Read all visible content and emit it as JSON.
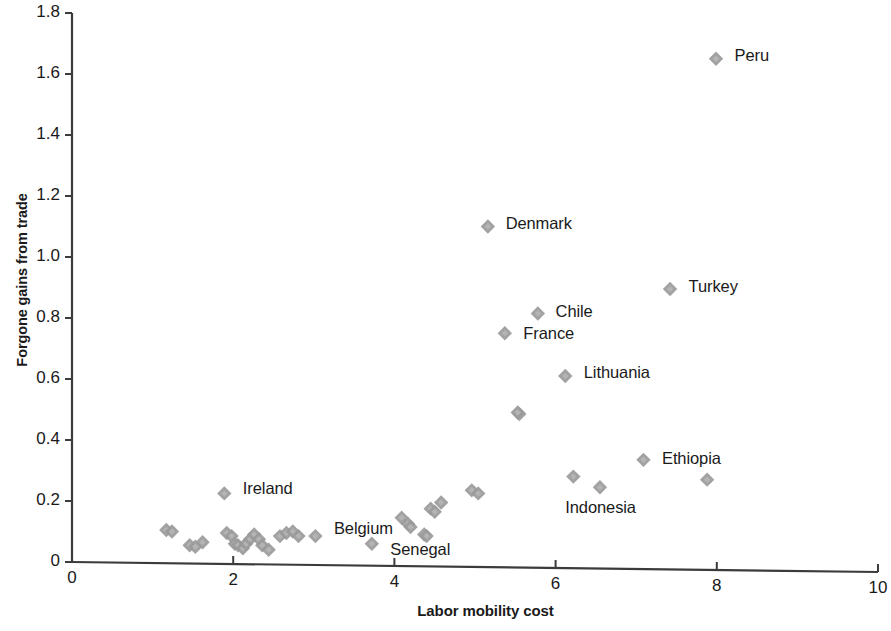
{
  "chart_data": {
    "type": "scatter",
    "title": "",
    "xlabel": "Labor mobility cost",
    "ylabel": "Forgone gains from trade",
    "xlim": [
      0,
      10
    ],
    "ylim": [
      0,
      1.8
    ],
    "xticks": [
      "0",
      "2",
      "4",
      "6",
      "8",
      "10"
    ],
    "xtick_values": [
      0,
      2,
      4,
      6,
      8,
      10
    ],
    "yticks": [
      "0",
      "0.2",
      "0.4",
      "0.6",
      "0.8",
      "1.0",
      "1.2",
      "1.4",
      "1.6",
      "1.8"
    ],
    "ytick_values": [
      0,
      0.2,
      0.4,
      0.6,
      0.8,
      1.0,
      1.2,
      1.4,
      1.6,
      1.8
    ],
    "grid": false,
    "legend": "none",
    "marker": "diamond",
    "marker_color": "#9a9a9a",
    "axis_color": "#3b3b3b",
    "points": [
      {
        "x": 7.99,
        "y": 1.65,
        "label": "Peru"
      },
      {
        "x": 5.16,
        "y": 1.1,
        "label": "Denmark"
      },
      {
        "x": 7.42,
        "y": 0.895,
        "label": "Turkey"
      },
      {
        "x": 5.78,
        "y": 0.815,
        "label": "Chile"
      },
      {
        "x": 5.37,
        "y": 0.75,
        "label": "France"
      },
      {
        "x": 6.12,
        "y": 0.61,
        "label": "Lithuania"
      },
      {
        "x": 7.09,
        "y": 0.335,
        "label": "Ethiopia"
      },
      {
        "x": 6.55,
        "y": 0.245,
        "label": "Indonesia"
      },
      {
        "x": 1.89,
        "y": 0.225,
        "label": "Ireland"
      },
      {
        "x": 3.02,
        "y": 0.085,
        "label": "Belgium"
      },
      {
        "x": 3.72,
        "y": 0.06,
        "label": "Senegal"
      },
      {
        "x": 5.55,
        "y": 0.485,
        "label": ""
      },
      {
        "x": 5.53,
        "y": 0.49,
        "label": ""
      },
      {
        "x": 7.88,
        "y": 0.27,
        "label": ""
      },
      {
        "x": 6.22,
        "y": 0.28,
        "label": ""
      },
      {
        "x": 4.96,
        "y": 0.235,
        "label": ""
      },
      {
        "x": 5.04,
        "y": 0.225,
        "label": ""
      },
      {
        "x": 4.58,
        "y": 0.195,
        "label": ""
      },
      {
        "x": 4.45,
        "y": 0.175,
        "label": ""
      },
      {
        "x": 4.5,
        "y": 0.165,
        "label": ""
      },
      {
        "x": 4.09,
        "y": 0.145,
        "label": ""
      },
      {
        "x": 4.17,
        "y": 0.125,
        "label": ""
      },
      {
        "x": 4.2,
        "y": 0.115,
        "label": ""
      },
      {
        "x": 4.37,
        "y": 0.09,
        "label": ""
      },
      {
        "x": 4.4,
        "y": 0.085,
        "label": ""
      },
      {
        "x": 1.17,
        "y": 0.105,
        "label": ""
      },
      {
        "x": 1.24,
        "y": 0.1,
        "label": ""
      },
      {
        "x": 1.46,
        "y": 0.055,
        "label": ""
      },
      {
        "x": 1.53,
        "y": 0.05,
        "label": ""
      },
      {
        "x": 1.62,
        "y": 0.065,
        "label": ""
      },
      {
        "x": 1.92,
        "y": 0.095,
        "label": ""
      },
      {
        "x": 1.98,
        "y": 0.085,
        "label": ""
      },
      {
        "x": 2.02,
        "y": 0.06,
        "label": ""
      },
      {
        "x": 2.06,
        "y": 0.055,
        "label": ""
      },
      {
        "x": 2.12,
        "y": 0.045,
        "label": ""
      },
      {
        "x": 2.16,
        "y": 0.06,
        "label": ""
      },
      {
        "x": 2.21,
        "y": 0.075,
        "label": ""
      },
      {
        "x": 2.26,
        "y": 0.09,
        "label": ""
      },
      {
        "x": 2.32,
        "y": 0.075,
        "label": ""
      },
      {
        "x": 2.36,
        "y": 0.055,
        "label": ""
      },
      {
        "x": 2.44,
        "y": 0.04,
        "label": ""
      },
      {
        "x": 2.58,
        "y": 0.085,
        "label": ""
      },
      {
        "x": 2.66,
        "y": 0.095,
        "label": ""
      },
      {
        "x": 2.74,
        "y": 0.1,
        "label": ""
      },
      {
        "x": 2.81,
        "y": 0.085,
        "label": ""
      }
    ],
    "annotations": [
      {
        "text": "Peru",
        "x": 8.22,
        "y": 1.655
      },
      {
        "text": "Denmark",
        "x": 5.38,
        "y": 1.105
      },
      {
        "text": "Turkey",
        "x": 7.65,
        "y": 0.9
      },
      {
        "text": "Chile",
        "x": 6.0,
        "y": 0.815
      },
      {
        "text": "France",
        "x": 5.6,
        "y": 0.745
      },
      {
        "text": "Lithuania",
        "x": 6.35,
        "y": 0.615
      },
      {
        "text": "Ethiopia",
        "x": 7.32,
        "y": 0.335
      },
      {
        "text": "Indonesia",
        "x": 6.12,
        "y": 0.175
      },
      {
        "text": "Ireland",
        "x": 2.12,
        "y": 0.235
      },
      {
        "text": "Belgium",
        "x": 3.25,
        "y": 0.105
      },
      {
        "text": "Senegal",
        "x": 3.95,
        "y": 0.035
      }
    ]
  }
}
